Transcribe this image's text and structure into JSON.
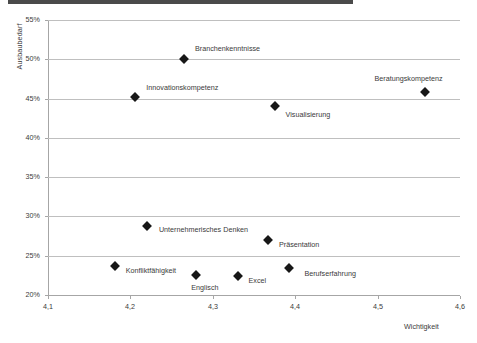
{
  "chart_data": {
    "type": "scatter",
    "title": "",
    "xlabel": "Wichtigkeit",
    "ylabel": "Ausbaubedarf",
    "xlim": [
      4.1,
      4.6
    ],
    "ylim": [
      0.2,
      0.55
    ],
    "x_ticks": [
      "4,1",
      "4,2",
      "4,3",
      "4,4",
      "4,5",
      "4,6"
    ],
    "x_tick_values": [
      4.1,
      4.2,
      4.3,
      4.4,
      4.5,
      4.6
    ],
    "y_ticks": [
      "20%",
      "25%",
      "30%",
      "35%",
      "40%",
      "45%",
      "50%",
      "55%"
    ],
    "y_tick_values": [
      0.2,
      0.25,
      0.3,
      0.35,
      0.4,
      0.45,
      0.5,
      0.55
    ],
    "grid": true,
    "legend": "none",
    "marker": "diamond",
    "marker_color": "#171717",
    "grid_color": "#bfbfbf",
    "points": [
      {
        "label": "Branchenkenntnisse",
        "x": 4.265,
        "y": 0.5,
        "label_dx": 11,
        "label_dy": -10
      },
      {
        "label": "Innovationskompetenz",
        "x": 4.206,
        "y": 0.452,
        "label_dx": 11,
        "label_dy": -9
      },
      {
        "label": "Beratungskompetenz",
        "x": 4.557,
        "y": 0.458,
        "label_dx": -50,
        "label_dy": -13
      },
      {
        "label": "Visualisierung",
        "x": 4.375,
        "y": 0.44,
        "label_dx": 11,
        "label_dy": 9
      },
      {
        "label": "Unternehmerisches Denken",
        "x": 4.22,
        "y": 0.288,
        "label_dx": 12,
        "label_dy": 4
      },
      {
        "label": "Präsentation",
        "x": 4.367,
        "y": 0.27,
        "label_dx": 11,
        "label_dy": 5
      },
      {
        "label": "Konfliktfähigkeit",
        "x": 4.181,
        "y": 0.237,
        "label_dx": 11,
        "label_dy": 5
      },
      {
        "label": "Englisch",
        "x": 4.28,
        "y": 0.225,
        "label_dx": -5,
        "label_dy": 13
      },
      {
        "label": "Excel",
        "x": 4.33,
        "y": 0.224,
        "label_dx": 11,
        "label_dy": 5
      },
      {
        "label": "Berufserfahrung",
        "x": 4.393,
        "y": 0.234,
        "label_dx": 15,
        "label_dy": 6
      }
    ]
  }
}
